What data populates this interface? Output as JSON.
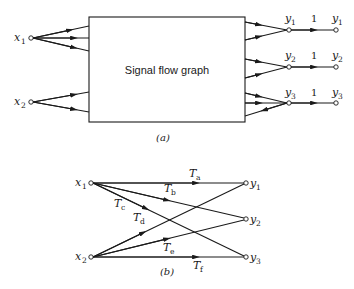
{
  "diagram_a": {
    "caption": "(a)",
    "box_label": "Signal flow graph",
    "inputs": [
      {
        "name": "x",
        "sub": "1"
      },
      {
        "name": "x",
        "sub": "2"
      }
    ],
    "outputs": [
      {
        "name": "y",
        "sub": "1",
        "gain": "1"
      },
      {
        "name": "y",
        "sub": "2",
        "gain": "1"
      },
      {
        "name": "y",
        "sub": "3",
        "gain": "1"
      }
    ]
  },
  "diagram_b": {
    "caption": "(b)",
    "inputs": [
      {
        "name": "x",
        "sub": "1"
      },
      {
        "name": "x",
        "sub": "2"
      }
    ],
    "outputs": [
      {
        "name": "y",
        "sub": "1"
      },
      {
        "name": "y",
        "sub": "2"
      },
      {
        "name": "y",
        "sub": "3"
      }
    ],
    "branches": [
      {
        "label": "T",
        "sub": "a",
        "from": "x1",
        "to": "y1"
      },
      {
        "label": "T",
        "sub": "b",
        "from": "x1",
        "to": "y2"
      },
      {
        "label": "T",
        "sub": "c",
        "from": "x1",
        "to": "y3"
      },
      {
        "label": "T",
        "sub": "d",
        "from": "x2",
        "to": "y1"
      },
      {
        "label": "T",
        "sub": "e",
        "from": "x2",
        "to": "y2"
      },
      {
        "label": "T",
        "sub": "f",
        "from": "x2",
        "to": "y3"
      }
    ]
  }
}
